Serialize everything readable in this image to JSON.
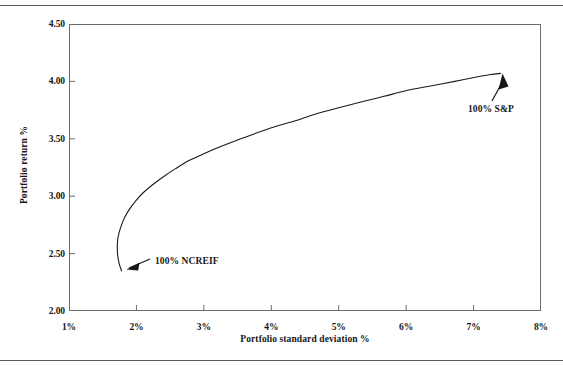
{
  "figure": {
    "background": "#ffffff",
    "line_color": "#1a1a1a",
    "frame_color": "#6b6b70",
    "rule_color": "#5a5a5e"
  },
  "chart_data": {
    "type": "line",
    "title": "",
    "xlabel": "Portfolio standard deviation %",
    "ylabel": "Portfolio return %",
    "xlim": [
      1,
      8
    ],
    "ylim": [
      2.0,
      4.5
    ],
    "xticks": [
      "1%",
      "2%",
      "3%",
      "4%",
      "5%",
      "6%",
      "7%",
      "8%"
    ],
    "xtick_values": [
      1,
      2,
      3,
      4,
      5,
      6,
      7,
      8
    ],
    "yticks": [
      "2.00",
      "2.50",
      "3.00",
      "3.50",
      "4.00",
      "4.50"
    ],
    "ytick_values": [
      2.0,
      2.5,
      3.0,
      3.5,
      4.0,
      4.5
    ],
    "grid": false,
    "legend": "none",
    "series": [
      {
        "name": "Efficient frontier",
        "x": [
          1.78,
          1.745,
          1.723,
          1.716,
          1.722,
          1.742,
          1.78,
          1.83,
          1.9,
          1.99,
          2.1,
          2.24,
          2.4,
          2.58,
          2.78,
          3.0,
          3.24,
          3.5,
          3.78,
          4.07,
          4.37,
          4.68,
          5.0,
          5.33,
          5.67,
          6.01,
          6.36,
          6.72,
          7.06,
          7.25,
          7.4
        ],
        "y": [
          2.35,
          2.41,
          2.48,
          2.55,
          2.62,
          2.68,
          2.75,
          2.82,
          2.89,
          2.96,
          3.03,
          3.1,
          3.17,
          3.24,
          3.31,
          3.37,
          3.43,
          3.49,
          3.55,
          3.61,
          3.66,
          3.72,
          3.77,
          3.82,
          3.87,
          3.92,
          3.96,
          4.0,
          4.04,
          4.06,
          4.07
        ]
      }
    ],
    "annotations": [
      {
        "id": "ncreif",
        "label": "100% NCREIF",
        "point_x": 1.78,
        "point_y": 2.35,
        "arrow": "points-down-left"
      },
      {
        "id": "sp",
        "label": "100% S&P",
        "point_x": 7.4,
        "point_y": 4.07,
        "arrow": "points-up-left"
      }
    ]
  }
}
